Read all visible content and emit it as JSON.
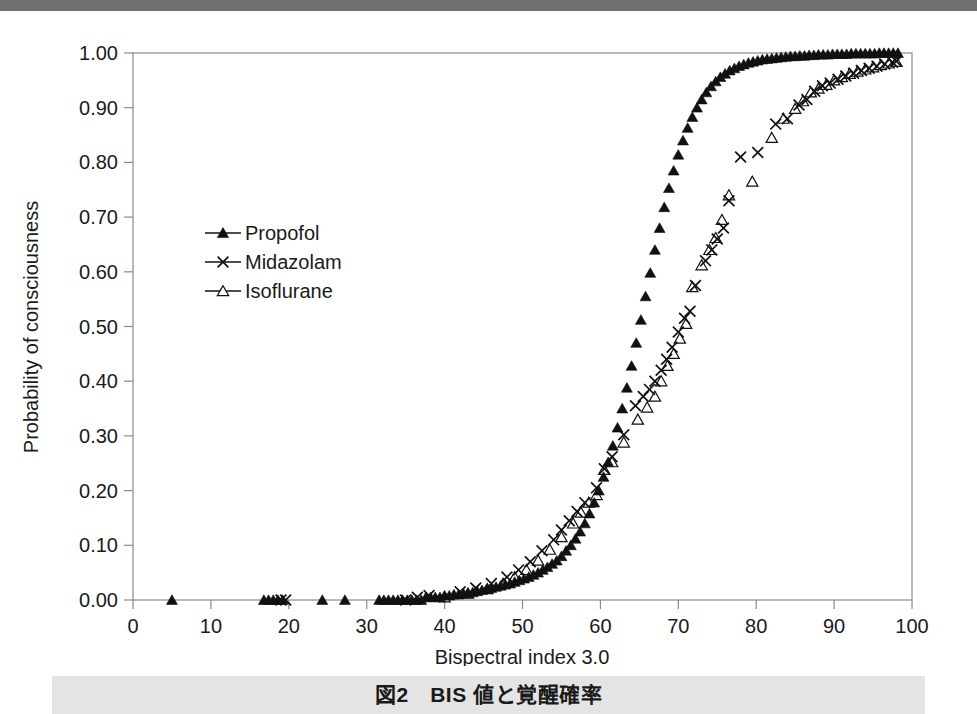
{
  "figure": {
    "caption": "図2　BIS 値と覚醒確率",
    "top_band_color": "#707070",
    "caption_band_color": "#e4e4e4"
  },
  "chart_data": {
    "type": "scatter",
    "title": "",
    "xlabel": "Bispectral index 3.0",
    "ylabel": "Probability of consciousness",
    "xlim": [
      0,
      100
    ],
    "ylim": [
      0.0,
      1.0
    ],
    "xticks": [
      0,
      10,
      20,
      30,
      40,
      50,
      60,
      70,
      80,
      90,
      100
    ],
    "xticklabels": [
      "0",
      "10",
      "20",
      "30",
      "40",
      "50",
      "60",
      "70",
      "80",
      "90",
      "100"
    ],
    "yticks": [
      0.0,
      0.1,
      0.2,
      0.3,
      0.4,
      0.5,
      0.6,
      0.7,
      0.8,
      0.9,
      1.0
    ],
    "yticklabels": [
      "0.00",
      "0.10",
      "0.20",
      "0.30",
      "0.40",
      "0.50",
      "0.60",
      "0.70",
      "0.80",
      "0.90",
      "1.00"
    ],
    "grid": false,
    "legend_position": "upper-left-inside",
    "marker_color": "#111111",
    "series": [
      {
        "name": "Propofol",
        "marker": "filled-triangle",
        "points": [
          [
            5.0,
            0.0
          ],
          [
            16.8,
            0.0
          ],
          [
            17.4,
            0.0
          ],
          [
            18.0,
            0.0
          ],
          [
            18.6,
            0.0
          ],
          [
            19.2,
            0.0
          ],
          [
            24.3,
            0.0
          ],
          [
            27.2,
            0.0
          ],
          [
            31.6,
            0.0
          ],
          [
            32.2,
            0.0
          ],
          [
            32.8,
            0.0
          ],
          [
            33.4,
            0.0
          ],
          [
            34.0,
            0.0
          ],
          [
            34.6,
            0.0
          ],
          [
            35.2,
            0.0
          ],
          [
            35.8,
            0.0
          ],
          [
            36.4,
            0.0
          ],
          [
            37.0,
            0.0
          ],
          [
            37.6,
            0.005
          ],
          [
            38.2,
            0.005
          ],
          [
            38.8,
            0.005
          ],
          [
            39.4,
            0.005
          ],
          [
            40.0,
            0.008
          ],
          [
            40.6,
            0.008
          ],
          [
            41.2,
            0.01
          ],
          [
            41.8,
            0.01
          ],
          [
            42.4,
            0.012
          ],
          [
            43.0,
            0.012
          ],
          [
            43.6,
            0.014
          ],
          [
            44.2,
            0.016
          ],
          [
            44.8,
            0.018
          ],
          [
            45.4,
            0.02
          ],
          [
            46.0,
            0.022
          ],
          [
            46.6,
            0.024
          ],
          [
            47.2,
            0.026
          ],
          [
            47.8,
            0.028
          ],
          [
            48.4,
            0.03
          ],
          [
            49.0,
            0.033
          ],
          [
            49.6,
            0.036
          ],
          [
            50.2,
            0.039
          ],
          [
            50.8,
            0.042
          ],
          [
            51.4,
            0.046
          ],
          [
            52.0,
            0.05
          ],
          [
            52.6,
            0.055
          ],
          [
            53.2,
            0.06
          ],
          [
            53.8,
            0.066
          ],
          [
            54.4,
            0.072
          ],
          [
            55.0,
            0.08
          ],
          [
            55.6,
            0.09
          ],
          [
            56.2,
            0.1
          ],
          [
            56.8,
            0.112
          ],
          [
            57.4,
            0.125
          ],
          [
            58.0,
            0.14
          ],
          [
            58.6,
            0.158
          ],
          [
            59.2,
            0.178
          ],
          [
            59.8,
            0.2
          ],
          [
            60.4,
            0.225
          ],
          [
            61.0,
            0.252
          ],
          [
            61.6,
            0.282
          ],
          [
            62.2,
            0.315
          ],
          [
            62.8,
            0.35
          ],
          [
            63.4,
            0.388
          ],
          [
            64.0,
            0.428
          ],
          [
            64.6,
            0.47
          ],
          [
            65.2,
            0.512
          ],
          [
            65.8,
            0.555
          ],
          [
            66.4,
            0.598
          ],
          [
            67.0,
            0.64
          ],
          [
            67.6,
            0.68
          ],
          [
            68.2,
            0.718
          ],
          [
            68.8,
            0.753
          ],
          [
            69.4,
            0.785
          ],
          [
            70.0,
            0.814
          ],
          [
            70.6,
            0.84
          ],
          [
            71.2,
            0.863
          ],
          [
            71.8,
            0.883
          ],
          [
            72.4,
            0.9
          ],
          [
            73.0,
            0.915
          ],
          [
            73.6,
            0.928
          ],
          [
            74.2,
            0.939
          ],
          [
            74.8,
            0.948
          ],
          [
            75.4,
            0.956
          ],
          [
            76.0,
            0.962
          ],
          [
            76.6,
            0.968
          ],
          [
            77.2,
            0.972
          ],
          [
            77.8,
            0.976
          ],
          [
            78.4,
            0.979
          ],
          [
            79.0,
            0.982
          ],
          [
            79.6,
            0.984
          ],
          [
            80.2,
            0.986
          ],
          [
            80.8,
            0.988
          ],
          [
            81.4,
            0.989
          ],
          [
            82.0,
            0.99
          ],
          [
            82.6,
            0.991
          ],
          [
            83.2,
            0.992
          ],
          [
            83.8,
            0.993
          ],
          [
            84.4,
            0.994
          ],
          [
            85.0,
            0.994
          ],
          [
            85.6,
            0.995
          ],
          [
            86.2,
            0.995
          ],
          [
            86.8,
            0.996
          ],
          [
            87.4,
            0.996
          ],
          [
            88.0,
            0.997
          ],
          [
            88.6,
            0.997
          ],
          [
            89.2,
            0.997
          ],
          [
            89.8,
            0.998
          ],
          [
            90.4,
            0.998
          ],
          [
            91.0,
            0.998
          ],
          [
            91.6,
            0.998
          ],
          [
            92.2,
            0.999
          ],
          [
            92.8,
            0.999
          ],
          [
            93.4,
            0.999
          ],
          [
            94.0,
            0.999
          ],
          [
            94.6,
            0.999
          ],
          [
            95.2,
            0.999
          ],
          [
            95.8,
            1.0
          ],
          [
            96.4,
            1.0
          ],
          [
            97.0,
            1.0
          ],
          [
            97.6,
            1.0
          ],
          [
            98.2,
            1.0
          ]
        ]
      },
      {
        "name": "Midazolam",
        "marker": "cross",
        "points": [
          [
            19.0,
            0.0
          ],
          [
            19.6,
            0.0
          ],
          [
            35.0,
            0.0
          ],
          [
            36.5,
            0.005
          ],
          [
            38.0,
            0.008
          ],
          [
            42.0,
            0.015
          ],
          [
            44.0,
            0.022
          ],
          [
            46.0,
            0.03
          ],
          [
            48.0,
            0.042
          ],
          [
            49.5,
            0.055
          ],
          [
            51.0,
            0.07
          ],
          [
            52.5,
            0.09
          ],
          [
            54.0,
            0.11
          ],
          [
            55.0,
            0.128
          ],
          [
            56.0,
            0.145
          ],
          [
            57.0,
            0.162
          ],
          [
            58.0,
            0.178
          ],
          [
            59.5,
            0.205
          ],
          [
            60.5,
            0.24
          ],
          [
            61.5,
            0.262
          ],
          [
            63.0,
            0.302
          ],
          [
            64.5,
            0.355
          ],
          [
            65.5,
            0.372
          ],
          [
            66.3,
            0.385
          ],
          [
            67.0,
            0.4
          ],
          [
            67.8,
            0.42
          ],
          [
            68.5,
            0.44
          ],
          [
            69.2,
            0.462
          ],
          [
            70.0,
            0.49
          ],
          [
            70.8,
            0.515
          ],
          [
            71.5,
            0.528
          ],
          [
            72.2,
            0.575
          ],
          [
            73.5,
            0.62
          ],
          [
            74.3,
            0.64
          ],
          [
            75.0,
            0.66
          ],
          [
            75.8,
            0.68
          ],
          [
            76.5,
            0.73
          ],
          [
            78.0,
            0.81
          ],
          [
            80.2,
            0.818
          ],
          [
            82.5,
            0.87
          ],
          [
            84.0,
            0.88
          ],
          [
            85.5,
            0.905
          ],
          [
            86.5,
            0.915
          ],
          [
            87.5,
            0.93
          ],
          [
            88.5,
            0.94
          ],
          [
            89.5,
            0.945
          ],
          [
            90.5,
            0.952
          ],
          [
            91.5,
            0.958
          ],
          [
            92.5,
            0.963
          ],
          [
            93.5,
            0.968
          ],
          [
            94.5,
            0.972
          ],
          [
            95.5,
            0.976
          ],
          [
            96.5,
            0.98
          ],
          [
            97.5,
            0.983
          ],
          [
            98.0,
            0.985
          ]
        ]
      },
      {
        "name": "Isoflurane",
        "marker": "open-triangle",
        "points": [
          [
            40.0,
            0.005
          ],
          [
            43.0,
            0.012
          ],
          [
            45.5,
            0.02
          ],
          [
            47.5,
            0.03
          ],
          [
            49.0,
            0.042
          ],
          [
            50.5,
            0.055
          ],
          [
            52.0,
            0.072
          ],
          [
            53.5,
            0.092
          ],
          [
            55.0,
            0.115
          ],
          [
            56.5,
            0.14
          ],
          [
            57.5,
            0.16
          ],
          [
            58.5,
            0.178
          ],
          [
            59.5,
            0.192
          ],
          [
            60.5,
            0.238
          ],
          [
            61.5,
            0.252
          ],
          [
            63.0,
            0.288
          ],
          [
            64.8,
            0.33
          ],
          [
            66.0,
            0.352
          ],
          [
            67.0,
            0.372
          ],
          [
            67.8,
            0.4
          ],
          [
            68.6,
            0.428
          ],
          [
            69.4,
            0.45
          ],
          [
            70.2,
            0.478
          ],
          [
            71.0,
            0.505
          ],
          [
            71.8,
            0.572
          ],
          [
            73.0,
            0.612
          ],
          [
            74.0,
            0.64
          ],
          [
            74.8,
            0.662
          ],
          [
            75.6,
            0.695
          ],
          [
            76.5,
            0.74
          ],
          [
            79.5,
            0.765
          ],
          [
            82.0,
            0.845
          ],
          [
            83.5,
            0.88
          ],
          [
            85.0,
            0.898
          ],
          [
            86.0,
            0.912
          ],
          [
            87.0,
            0.928
          ],
          [
            88.0,
            0.935
          ],
          [
            89.0,
            0.942
          ],
          [
            90.0,
            0.95
          ],
          [
            91.0,
            0.956
          ],
          [
            92.0,
            0.962
          ],
          [
            93.0,
            0.966
          ],
          [
            94.0,
            0.97
          ],
          [
            95.0,
            0.974
          ],
          [
            96.0,
            0.978
          ],
          [
            97.0,
            0.981
          ],
          [
            98.0,
            0.984
          ]
        ]
      }
    ]
  }
}
